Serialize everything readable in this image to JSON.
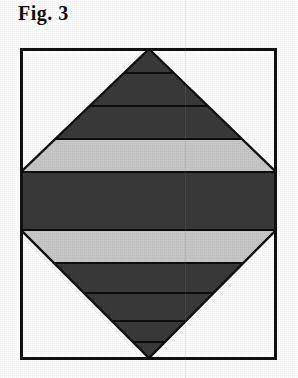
{
  "figure": {
    "caption": "Fig. 3",
    "page_background": "#ffffff"
  },
  "plate": {
    "border_color": "#111111",
    "border_width_px": 3,
    "fill": "#ffffff",
    "x": 20,
    "y": 48,
    "width": 257,
    "height": 312
  },
  "colors": {
    "dark_band": "#3a3a3a",
    "light_band": "#c8c8c8",
    "separator_line": "#0d0d0d",
    "outline": "#111111",
    "background": "#ffffff",
    "fold_artifact": "#787878"
  },
  "shape": {
    "name": "banded-rhombus",
    "description": "Rhombus (diamond) with apex at top-center and bottom-center, left and right vertices truncated flat against the plate side edges, subdivided by horizontal bands alternating dark and light gray.",
    "top_vertex": [
      129,
      1
    ],
    "bottom_vertex": [
      129,
      310
    ],
    "left_edge_x": 1,
    "right_edge_x": 256,
    "waist_top_y": 124,
    "waist_bottom_y": 182
  },
  "bands": [
    {
      "index": 1,
      "label": "band-1-dark",
      "tone": "dark",
      "color": "#3a3a3a",
      "top_y": 1,
      "bottom_y": 25
    },
    {
      "index": 2,
      "label": "band-2-dark",
      "tone": "dark",
      "color": "#3a3a3a",
      "top_y": 25,
      "bottom_y": 58
    },
    {
      "index": 3,
      "label": "band-3-dark",
      "tone": "dark",
      "color": "#3a3a3a",
      "top_y": 58,
      "bottom_y": 91
    },
    {
      "index": 4,
      "label": "band-4-light",
      "tone": "light",
      "color": "#c8c8c8",
      "top_y": 91,
      "bottom_y": 124
    },
    {
      "index": 5,
      "label": "band-5-dark",
      "tone": "dark",
      "color": "#3a3a3a",
      "top_y": 124,
      "bottom_y": 182
    },
    {
      "index": 6,
      "label": "band-6-light",
      "tone": "light",
      "color": "#c8c8c8",
      "top_y": 182,
      "bottom_y": 215
    },
    {
      "index": 7,
      "label": "band-7-dark",
      "tone": "dark",
      "color": "#3a3a3a",
      "top_y": 215,
      "bottom_y": 245
    },
    {
      "index": 8,
      "label": "band-8-dark",
      "tone": "dark",
      "color": "#3a3a3a",
      "top_y": 245,
      "bottom_y": 273
    },
    {
      "index": 9,
      "label": "band-9-dark",
      "tone": "dark",
      "color": "#3a3a3a",
      "top_y": 273,
      "bottom_y": 294
    },
    {
      "index": 10,
      "label": "band-10-dark",
      "tone": "dark",
      "color": "#3a3a3a",
      "top_y": 294,
      "bottom_y": 310
    }
  ],
  "separators": [
    25,
    58,
    91,
    124,
    182,
    215,
    245,
    273,
    294
  ]
}
